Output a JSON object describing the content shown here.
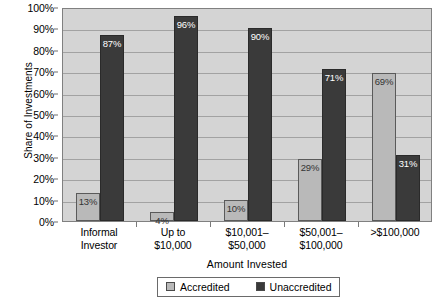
{
  "chart_data": {
    "type": "bar",
    "title": "",
    "xlabel": "Amount Invested",
    "ylabel": "Share of Investments",
    "ylim": [
      0,
      100
    ],
    "yticks": [
      "0%",
      "10%",
      "20%",
      "30%",
      "40%",
      "50%",
      "60%",
      "70%",
      "80%",
      "90%",
      "100%"
    ],
    "grid": true,
    "legend_position": "bottom",
    "categories": [
      "Informal Investor",
      "Up to $10,000",
      "$10,001– $50,000",
      "$50,001– $100,000",
      ">$100,000"
    ],
    "category_lines": [
      [
        "Informal",
        "Investor"
      ],
      [
        "Up to",
        "$10,000"
      ],
      [
        "$10,001–",
        "$50,000"
      ],
      [
        "$50,001–",
        "$100,000"
      ],
      [
        ">$100,000",
        ""
      ]
    ],
    "series": [
      {
        "name": "Accredited",
        "color": "#b9b9b9",
        "values": [
          13,
          4,
          10,
          29,
          69
        ],
        "labels": [
          "13%",
          "4%",
          "10%",
          "29%",
          "69%"
        ]
      },
      {
        "name": "Unaccredited",
        "color": "#3a3a3a",
        "values": [
          87,
          96,
          90,
          71,
          31
        ],
        "labels": [
          "87%",
          "96%",
          "90%",
          "71%",
          "31%"
        ]
      }
    ]
  },
  "legend": {
    "items": [
      {
        "label": "Accredited",
        "swatch": "accredited-swatch"
      },
      {
        "label": "Unaccredited",
        "swatch": "unaccredited-swatch"
      }
    ]
  },
  "colors": {
    "plot_background": "#d4d4d4",
    "gridline": "#a2a2a2",
    "accredited": "#b9b9b9",
    "unaccredited": "#3a3a3a",
    "axis": "#808080"
  }
}
